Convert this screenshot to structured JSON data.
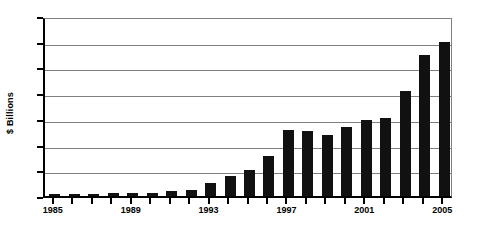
{
  "chart_data": {
    "type": "bar",
    "title": "",
    "subtitle": "",
    "xlabel": "",
    "ylabel": "$ Billions",
    "categories": [
      "1985",
      "1986",
      "1987",
      "1988",
      "1989",
      "1990",
      "1991",
      "1992",
      "1993",
      "1994",
      "1995",
      "1996",
      "1997",
      "1998",
      "1999",
      "2000",
      "2001",
      "2002",
      "2003",
      "2004",
      "2005"
    ],
    "values": [
      4,
      4,
      4,
      6,
      6,
      5,
      9,
      11,
      26,
      39,
      50,
      78,
      128,
      126,
      118,
      134,
      147,
      151,
      204,
      274,
      300
    ],
    "series": [
      {
        "name": "$ Billions",
        "values": [
          4,
          4,
          4,
          6,
          6,
          5,
          9,
          11,
          26,
          39,
          50,
          78,
          128,
          126,
          118,
          134,
          147,
          151,
          204,
          274,
          300
        ]
      }
    ],
    "ylim": [
      0,
      350
    ],
    "y_ticks": [
      0,
      50,
      100,
      150,
      200,
      250,
      300,
      350
    ],
    "y_tick_labels": [
      "0",
      "50",
      "100",
      "150",
      "200",
      "250",
      "300",
      "350"
    ],
    "x_tick_labels": [
      "1985",
      "1989",
      "1993",
      "1997",
      "2001",
      "2005"
    ],
    "x_tick_label_indices": [
      0,
      4,
      8,
      12,
      16,
      20
    ],
    "grid": true,
    "grid_axis": "y",
    "legend": false,
    "legend_position": "none",
    "bar_color": "#111111",
    "grid_color": "#808080",
    "axis_color": "#000000",
    "background_color": "#ffffff",
    "annotations": []
  }
}
